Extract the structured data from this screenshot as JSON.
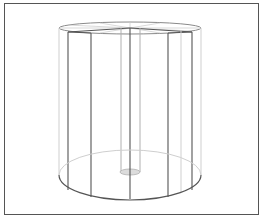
{
  "diagram": {
    "colors": {
      "frame": "#555555",
      "dark_line": "#555555",
      "light_line": "#c8c8c8",
      "mid_line": "#8a8a8a",
      "base_disc_fill": "#dcdcdc",
      "background": "#ffffff"
    },
    "cylinder": {
      "center_x": 130,
      "top_y": 27,
      "bottom_y": 175,
      "rx": 71,
      "ry_top": 7,
      "ry_bottom": 25
    },
    "rod": {
      "x_left": 121,
      "x_right": 140,
      "base_y": 172,
      "base_rx": 10,
      "base_ry": 3
    }
  }
}
